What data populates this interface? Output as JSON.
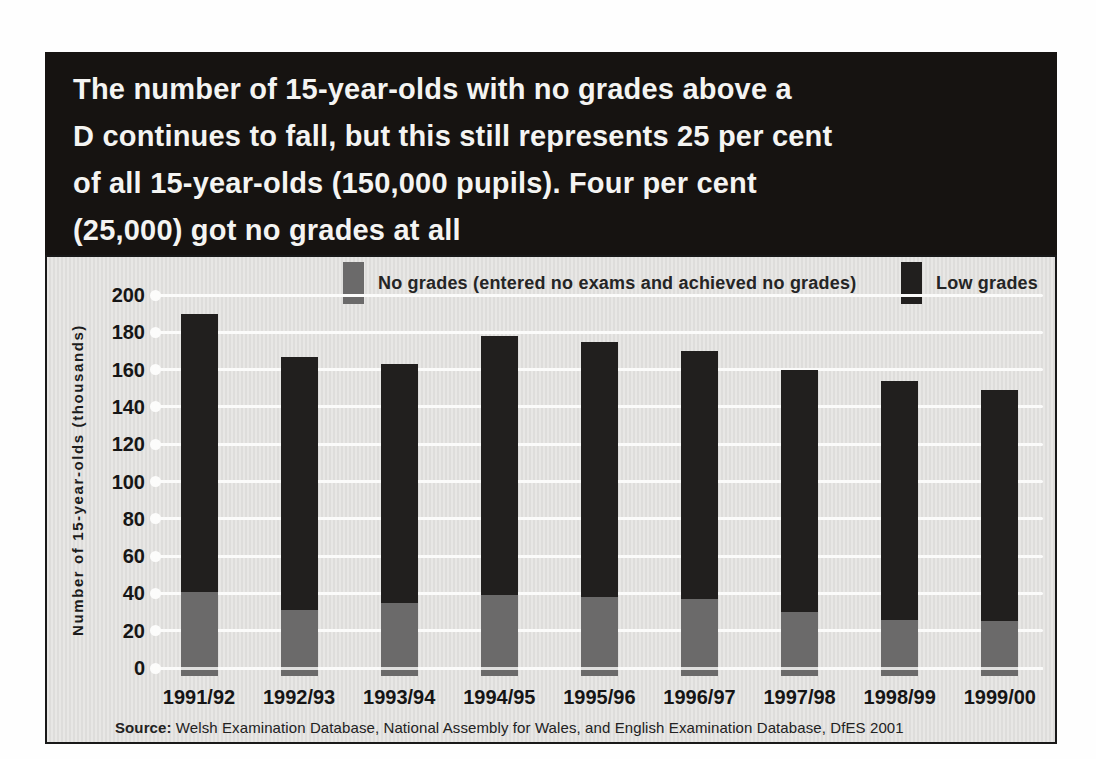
{
  "header": {
    "title_lines": [
      "The number of 15-year-olds with no grades above a",
      "D continues to fall, but this still represents 25 per cent",
      "of all 15-year-olds (150,000 pupils). Four per cent",
      "(25,000) got no grades at all"
    ]
  },
  "chart_data": {
    "type": "bar",
    "stacked": true,
    "title": "",
    "xlabel": "",
    "ylabel": "Number of 15-year-olds (thousands)",
    "ylim": [
      0,
      200
    ],
    "yticks": [
      0,
      20,
      40,
      60,
      80,
      100,
      120,
      140,
      160,
      180,
      200
    ],
    "grid": true,
    "legend_position": "top",
    "categories": [
      "1991/92",
      "1992/93",
      "1993/94",
      "1994/95",
      "1995/96",
      "1996/97",
      "1997/98",
      "1998/99",
      "1999/00"
    ],
    "series": [
      {
        "name": "No grades (entered no exams and achieved no grades)",
        "color": "#6b6a6a",
        "values": [
          41,
          31,
          35,
          39,
          38,
          37,
          30,
          26,
          25
        ]
      },
      {
        "name": "Low grades",
        "color": "#211f1e",
        "values": [
          149,
          136,
          128,
          139,
          137,
          133,
          130,
          128,
          124
        ]
      }
    ],
    "totals": [
      190,
      167,
      163,
      178,
      175,
      170,
      160,
      154,
      149
    ]
  },
  "source": {
    "label": "Source:",
    "text": " Welsh Examination Database, National Assembly for Wales, and English Examination Database, DfES 2001"
  },
  "colors": {
    "header_bg": "#161311",
    "header_text": "#f4f4f2",
    "panel_bg": "#e3e2e0",
    "gridline": "#fbfbfa",
    "no_grades": "#6b6a6a",
    "low_grades": "#211f1e"
  }
}
